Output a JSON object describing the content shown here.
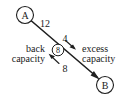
{
  "figure": {
    "type": "flow-network-residual-capacity-diagram",
    "background_color": "#ffffff",
    "ink_color": "#1f1f1f"
  },
  "nodes": [
    {
      "id": "A",
      "label": "A",
      "cx": 25,
      "cy": 15,
      "r": 8.5
    },
    {
      "id": "mid",
      "label": "8",
      "cx": 58,
      "cy": 50,
      "r": 5.8
    },
    {
      "id": "B",
      "label": "B",
      "cx": 105,
      "cy": 85,
      "r": 8.5
    }
  ],
  "edge": {
    "from": "A",
    "to": "B",
    "direction": "A-to-B",
    "arrowhead_at": "B"
  },
  "edge_labels": [
    {
      "name": "upper-capacity",
      "text": "12",
      "x": 45,
      "y": 23
    },
    {
      "name": "excess-value",
      "text": "4",
      "x": 65,
      "y": 38
    },
    {
      "name": "back-value",
      "text": "8",
      "x": 65,
      "y": 68
    }
  ],
  "annotations": [
    {
      "name": "back-capacity",
      "line1": "back",
      "line2": "capacity",
      "side": "left",
      "anchor_x": 45,
      "line1_y": 48,
      "line2_y": 58,
      "pointer": {
        "x1": 42,
        "y1": 62,
        "x2": 52,
        "y2": 54
      }
    },
    {
      "name": "excess-capacity",
      "line1": "excess",
      "line2": "capacity",
      "side": "right",
      "anchor_x": 82,
      "line1_y": 48,
      "line2_y": 58,
      "pointer": {
        "x1": 66,
        "y1": 40,
        "x2": 76,
        "y2": 49
      }
    }
  ]
}
